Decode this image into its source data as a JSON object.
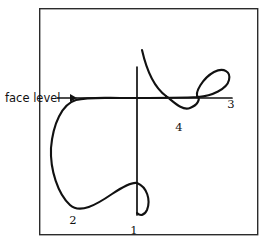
{
  "figure": {
    "background_color": "#ffffff",
    "ink_color": "#111111",
    "frame_color": "#2b2b2b",
    "frame": {
      "x": 39,
      "y": 8,
      "width": 219,
      "height": 227
    },
    "annotation": {
      "label": "face level",
      "label_x": 5,
      "label_y": 102,
      "arrow_name": "right-arrow",
      "arrow_from_x": 57,
      "arrow_to_x": 76,
      "arrow_y": 98
    },
    "reference_lines": {
      "face_level": {
        "name": "face-level-line",
        "y": 98,
        "x_start": 76,
        "x_end": 232
      },
      "vertical": {
        "name": "vertical-reference-line",
        "x": 137,
        "y_start": 67,
        "y_end": 215
      }
    },
    "markers": [
      {
        "id": "1",
        "label": "1",
        "x": 137,
        "y": 230
      },
      {
        "id": "2",
        "label": "2",
        "x": 73,
        "y": 220
      },
      {
        "id": "3",
        "label": "3",
        "x": 231,
        "y": 104
      },
      {
        "id": "4",
        "label": "4",
        "x": 179,
        "y": 127
      }
    ],
    "path_segments": [
      {
        "name": "descending-entry-curve",
        "d": "M 142 50 C 147 72, 155 88, 166 96"
      },
      {
        "name": "dip-and-loop-curve",
        "d": "M 166 96 C 174 102, 182 111, 190 108 C 198 105, 200 99, 198 97 C 194 93, 203 78, 214 72 C 224 67, 231 72, 229 80 C 227 89, 212 96, 198 97 C 184 98, 160 98, 120 98 C 104 98, 88 97, 76 100 C 62 104, 53 124, 51 148 C 50 170, 58 194, 70 205 C 80 214, 96 205, 112 194 C 124 186, 132 182, 137 183"
      },
      {
        "name": "lower-hook-leaf",
        "d": "M 137 183 C 147 187, 151 200, 147 210 C 144 216, 140 216, 137 213"
      }
    ]
  }
}
